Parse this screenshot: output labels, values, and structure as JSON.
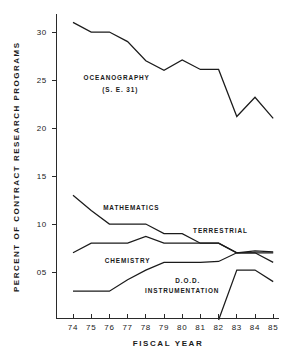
{
  "chart_data": {
    "type": "line",
    "title": "",
    "xlabel": "FISCAL   YEAR",
    "ylabel": "PERCENT OF CONTRACT  RESEARCH  PROGRAMS",
    "categories": [
      "74",
      "75",
      "76",
      "77",
      "78",
      "79",
      "80",
      "81",
      "82",
      "83",
      "84",
      "85"
    ],
    "x_tick_labels": [
      "74",
      "75",
      "76",
      "77",
      "78",
      "79",
      "80",
      "81",
      "82",
      "83",
      "84",
      "85"
    ],
    "y_tick_labels": [
      "05",
      "10",
      "15",
      "20",
      "25",
      "30"
    ],
    "y_tick_values": [
      5,
      10,
      15,
      20,
      25,
      30
    ],
    "xlim": [
      74,
      85
    ],
    "ylim": [
      0,
      32
    ],
    "grid": false,
    "legend": "inline-annotations",
    "series": [
      {
        "name": "OCEANOGRAPHY",
        "label": "OCEANOGRAPHY",
        "sublabel": "(S. E. 31)",
        "values": [
          31.0,
          30.0,
          30.0,
          29.0,
          27.0,
          26.0,
          27.1,
          26.1,
          26.1,
          21.2,
          23.2,
          21.0
        ]
      },
      {
        "name": "MATHEMATICS",
        "label": "MATHEMATICS",
        "sublabel": "",
        "values": [
          13.0,
          11.4,
          10.0,
          10.0,
          10.0,
          9.0,
          9.0,
          8.0,
          8.0,
          7.0,
          7.0,
          7.0
        ]
      },
      {
        "name": "TERRESTRIAL",
        "label": "TERRESTRIAL",
        "sublabel": "",
        "values": [
          7.0,
          8.0,
          8.0,
          8.0,
          8.7,
          8.0,
          8.0,
          8.0,
          8.0,
          7.0,
          7.0,
          6.0
        ]
      },
      {
        "name": "CHEMISTRY",
        "label": "CHEMISTRY",
        "sublabel": "",
        "values": [
          3.0,
          3.0,
          3.0,
          4.2,
          5.2,
          6.0,
          6.0,
          6.0,
          6.1,
          7.0,
          7.2,
          7.1
        ]
      },
      {
        "name": "D.O.D. INSTRUMENTATION",
        "label": "D.O.D.",
        "sublabel": "INSTRUMENTATION",
        "values": [
          null,
          null,
          null,
          null,
          null,
          null,
          null,
          null,
          0.0,
          5.2,
          5.2,
          4.0
        ]
      }
    ],
    "annotations": [
      {
        "text": "OCEANOGRAPHY",
        "x": 76.4,
        "y": 25.0
      },
      {
        "text": "(S. E. 31)",
        "x": 76.6,
        "y": 23.7
      },
      {
        "text": "MATHEMATICS",
        "x": 77.2,
        "y": 11.5
      },
      {
        "text": "TERRESTRIAL",
        "x": 82.1,
        "y": 9.1
      },
      {
        "text": "CHEMISTRY",
        "x": 77.0,
        "y": 5.9
      },
      {
        "text": "D.O.D.",
        "x": 80.3,
        "y": 3.9
      },
      {
        "text": "INSTRUMENTATION",
        "x": 80.0,
        "y": 2.8
      }
    ],
    "colors": {
      "line": "#1b1b1b",
      "axis": "#2a2a2a",
      "background": "#ffffff",
      "text": "#1a1a1a"
    }
  }
}
